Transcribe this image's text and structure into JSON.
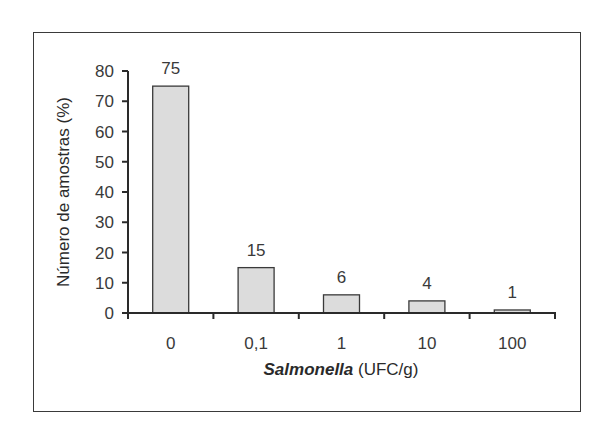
{
  "chart_data": {
    "type": "bar",
    "title": "",
    "xlabel": "Salmonella (UFC/g)",
    "xlabel_italic_part": "Salmonella",
    "xlabel_rest": " (UFC/g)",
    "ylabel": "Número de amostras (%)",
    "categories": [
      "0",
      "0,1",
      "1",
      "10",
      "100"
    ],
    "values": [
      75,
      15,
      6,
      4,
      1
    ],
    "data_labels": [
      "75",
      "15",
      "6",
      "4",
      "1"
    ],
    "ylim": [
      0,
      80
    ],
    "yticks": [
      "0",
      "10",
      "20",
      "30",
      "40",
      "50",
      "60",
      "70",
      "80"
    ],
    "grid": false,
    "legend": null,
    "bar_color": "#dcdcdc",
    "bar_edge_color": "#3a3a3a"
  }
}
